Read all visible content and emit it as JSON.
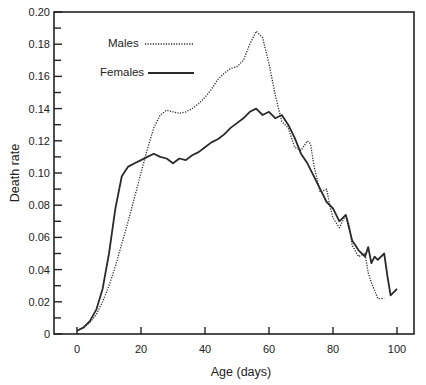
{
  "chart_data": {
    "type": "line",
    "title": "",
    "xlabel": "Age (days)",
    "ylabel": "Death rate",
    "xlim": [
      -8,
      107
    ],
    "ylim": [
      0,
      0.2
    ],
    "xticks": [
      0,
      20,
      40,
      60,
      80,
      100
    ],
    "xtick_labels": [
      "0",
      "20",
      "40",
      "60",
      "80",
      "100"
    ],
    "yticks": [
      0,
      0.02,
      0.04,
      0.06,
      0.08,
      0.1,
      0.12,
      0.14,
      0.16,
      0.18,
      0.2
    ],
    "ytick_labels": [
      "0",
      "0.02",
      "0.04",
      "0.06",
      "0.08",
      "0.10",
      "0.12",
      "0.14",
      "0.16",
      "0.18",
      "0.20"
    ],
    "grid": false,
    "legend_position": "upper-left (inside)",
    "series": [
      {
        "name": "Males",
        "style": "dotted",
        "x": [
          0,
          2,
          4,
          6,
          8,
          10,
          12,
          14,
          16,
          18,
          20,
          22,
          24,
          26,
          28,
          30,
          32,
          34,
          36,
          38,
          40,
          42,
          44,
          46,
          48,
          50,
          52,
          54,
          56,
          58,
          60,
          62,
          64,
          66,
          68,
          70,
          72,
          73,
          74,
          76,
          78,
          79,
          80,
          82,
          84,
          85,
          86,
          88,
          90,
          91,
          92,
          94,
          96
        ],
        "y": [
          0.002,
          0.004,
          0.007,
          0.012,
          0.02,
          0.03,
          0.042,
          0.056,
          0.07,
          0.085,
          0.1,
          0.115,
          0.128,
          0.136,
          0.139,
          0.138,
          0.137,
          0.138,
          0.14,
          0.143,
          0.147,
          0.152,
          0.158,
          0.162,
          0.165,
          0.166,
          0.17,
          0.18,
          0.188,
          0.184,
          0.168,
          0.148,
          0.132,
          0.128,
          0.116,
          0.114,
          0.12,
          0.118,
          0.105,
          0.088,
          0.09,
          0.08,
          0.072,
          0.066,
          0.074,
          0.068,
          0.055,
          0.048,
          0.05,
          0.038,
          0.032,
          0.022,
          0.022
        ]
      },
      {
        "name": "Females",
        "style": "solid",
        "x": [
          0,
          2,
          4,
          6,
          8,
          10,
          12,
          14,
          16,
          18,
          20,
          22,
          24,
          26,
          28,
          30,
          32,
          34,
          36,
          38,
          40,
          42,
          44,
          46,
          48,
          50,
          52,
          54,
          56,
          58,
          60,
          62,
          64,
          66,
          68,
          70,
          72,
          74,
          76,
          78,
          80,
          82,
          84,
          85,
          86,
          88,
          90,
          91,
          92,
          93,
          94,
          96,
          97,
          98,
          100
        ],
        "y": [
          0.002,
          0.004,
          0.008,
          0.015,
          0.028,
          0.05,
          0.078,
          0.098,
          0.104,
          0.106,
          0.108,
          0.11,
          0.112,
          0.11,
          0.109,
          0.106,
          0.109,
          0.108,
          0.111,
          0.113,
          0.116,
          0.119,
          0.121,
          0.124,
          0.128,
          0.131,
          0.134,
          0.138,
          0.14,
          0.136,
          0.138,
          0.134,
          0.136,
          0.13,
          0.122,
          0.112,
          0.106,
          0.098,
          0.09,
          0.082,
          0.078,
          0.07,
          0.074,
          0.066,
          0.058,
          0.052,
          0.048,
          0.054,
          0.044,
          0.048,
          0.046,
          0.05,
          0.036,
          0.024,
          0.028
        ]
      }
    ]
  },
  "legend": {
    "males_label": "Males",
    "females_label": "Females"
  },
  "axes": {
    "x_title": "Age (days)",
    "y_title": "Death rate"
  },
  "colors": {
    "line": "#2a2a2a",
    "axis": "#222222",
    "background": "#ffffff"
  }
}
